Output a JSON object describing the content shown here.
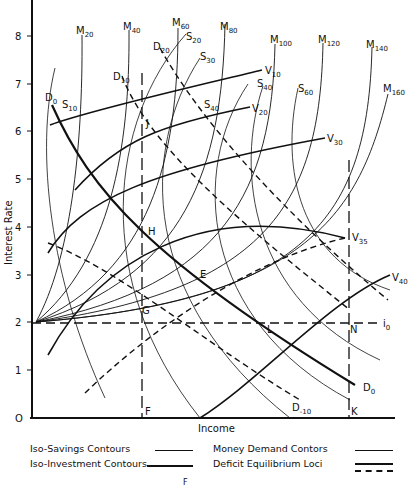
{
  "figure": {
    "x_axis_label": "Income",
    "y_axis_label": "Interest Rate",
    "origin_label": "O",
    "y_ticks": [
      "1",
      "2",
      "3",
      "4",
      "5",
      "6",
      "7",
      "8"
    ],
    "caption": "F"
  },
  "curve_labels": {
    "money": [
      {
        "base": "M",
        "sub": "20"
      },
      {
        "base": "M",
        "sub": "40"
      },
      {
        "base": "M",
        "sub": "60"
      },
      {
        "base": "M",
        "sub": "80"
      },
      {
        "base": "M",
        "sub": "100"
      },
      {
        "base": "M",
        "sub": "120"
      },
      {
        "base": "M",
        "sub": "140"
      },
      {
        "base": "M",
        "sub": "160"
      }
    ],
    "savings": [
      {
        "base": "S",
        "sub": "10"
      },
      {
        "base": "S",
        "sub": "20"
      },
      {
        "base": "S",
        "sub": "30"
      },
      {
        "base": "S",
        "sub": "40"
      },
      {
        "base": "S",
        "sub": "40"
      },
      {
        "base": "S",
        "sub": "60"
      }
    ],
    "investment": [
      {
        "base": "V",
        "sub": "10"
      },
      {
        "base": "V",
        "sub": "20"
      },
      {
        "base": "V",
        "sub": "30"
      },
      {
        "base": "V",
        "sub": "35"
      },
      {
        "base": "V",
        "sub": "40"
      }
    ],
    "deficit": [
      {
        "base": "D",
        "sub": "0"
      },
      {
        "base": "D",
        "sub": "10"
      },
      {
        "base": "D",
        "sub": "20"
      },
      {
        "base": "D",
        "sub": "0"
      },
      {
        "base": "D",
        "sub": "-10"
      }
    ],
    "i0": {
      "base": "i",
      "sub": "0"
    }
  },
  "points": [
    "J",
    "H",
    "E",
    "G",
    "L",
    "N",
    "F",
    "K"
  ],
  "legend": {
    "items": [
      {
        "label": "Iso-Savings Contours",
        "style": "thin"
      },
      {
        "label": "Iso-Investment Contours",
        "style": "thick"
      },
      {
        "label": "Money Demand Contors",
        "style": "thin"
      },
      {
        "label": "Deficit Equilibrium Loci",
        "style": "thick-and-dashed"
      }
    ]
  }
}
